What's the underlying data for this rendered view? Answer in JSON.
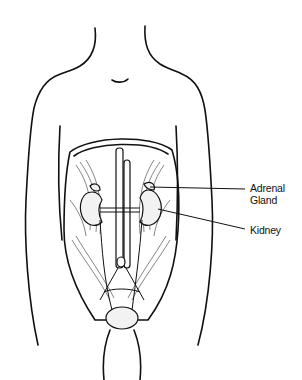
{
  "diagram": {
    "labels": [
      {
        "id": "adrenal",
        "line1": "Adrenal",
        "line2": "Gland"
      },
      {
        "id": "kidney",
        "line1": "Kidney"
      }
    ],
    "colors": {
      "ink": "#111111",
      "background": "#ffffff",
      "organ_fill": "#f2f2f2"
    }
  }
}
